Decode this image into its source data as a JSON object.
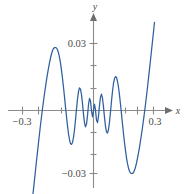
{
  "chart_data": {
    "type": "line",
    "title": "",
    "subtitle": "",
    "xlabel": "x",
    "ylabel": "y",
    "xlim": [
      -0.33,
      0.33
    ],
    "ylim": [
      -0.038,
      0.038
    ],
    "grid": false,
    "legend": null,
    "axis_style": "arrowed-cartesian-axes-through-origin",
    "x_ticks": [
      -0.3,
      -0.2,
      -0.1,
      0.1,
      0.2,
      0.3
    ],
    "x_tick_labels": [
      "-0.3",
      "",
      "",
      "",
      "",
      "0.3"
    ],
    "y_ticks": [
      -0.03,
      -0.02,
      -0.01,
      0.01,
      0.02,
      0.03
    ],
    "y_tick_labels": [
      "-0.03",
      "",
      "",
      "",
      "",
      "0.03"
    ],
    "series": [
      {
        "name": "f(x)",
        "color": "#2e5f9e",
        "description": "even damped-oscillation curve: tiny ripples near the origin whose amplitude grows with |x|, peaks of about 0.028 near x = -0.185 and x = 0.185, crossing zero near x = +/-0.255 and plunging below -0.03 by x = +/-0.30",
        "x": [
          -0.305,
          -0.3,
          -0.295,
          -0.29,
          -0.285,
          -0.28,
          -0.275,
          -0.27,
          -0.265,
          -0.26,
          -0.255,
          -0.25,
          -0.245,
          -0.24,
          -0.235,
          -0.23,
          -0.225,
          -0.22,
          -0.215,
          -0.21,
          -0.205,
          -0.2,
          -0.195,
          -0.19,
          -0.185,
          -0.18,
          -0.175,
          -0.17,
          -0.165,
          -0.16,
          -0.155,
          -0.15,
          -0.145,
          -0.14,
          -0.135,
          -0.13,
          -0.125,
          -0.12,
          -0.115,
          -0.11,
          -0.105,
          -0.1,
          -0.095,
          -0.09,
          -0.085,
          -0.08,
          -0.075,
          -0.07,
          -0.065,
          -0.06,
          -0.055,
          -0.05,
          -0.045,
          -0.04,
          -0.035,
          -0.03,
          -0.025,
          -0.02,
          -0.015,
          -0.01,
          -0.005,
          0.0,
          0.005,
          0.01,
          0.015,
          0.02,
          0.025,
          0.03,
          0.035,
          0.04,
          0.045,
          0.05,
          0.055,
          0.06,
          0.065,
          0.07,
          0.075,
          0.08,
          0.085,
          0.09,
          0.095,
          0.1,
          0.105,
          0.11,
          0.115,
          0.12,
          0.125,
          0.13,
          0.135,
          0.14,
          0.145,
          0.15,
          0.155,
          0.16,
          0.165,
          0.17,
          0.175,
          0.18,
          0.185,
          0.19,
          0.195,
          0.2,
          0.205,
          0.21,
          0.215,
          0.22,
          0.225,
          0.23,
          0.235,
          0.24,
          0.245,
          0.25,
          0.255,
          0.26,
          0.265,
          0.27,
          0.275,
          0.28,
          0.285,
          0.29,
          0.295,
          0.3,
          0.305
        ],
        "y": [
          -0.0395,
          -0.0352,
          -0.031,
          -0.0268,
          -0.0226,
          -0.0185,
          -0.0144,
          -0.0104,
          -0.0065,
          -0.0028,
          0.0008,
          0.0042,
          0.0075,
          0.0106,
          0.0136,
          0.0164,
          0.019,
          0.0213,
          0.0235,
          0.0253,
          0.0268,
          0.0278,
          0.0282,
          0.0282,
          0.028,
          0.0272,
          0.0258,
          0.0238,
          0.0212,
          0.018,
          0.0144,
          0.0104,
          0.0061,
          0.0016,
          -0.0028,
          -0.0069,
          -0.0104,
          -0.0131,
          -0.0148,
          -0.0152,
          -0.0143,
          -0.0121,
          -0.0086,
          -0.0042,
          0.0006,
          0.0051,
          0.0085,
          0.0101,
          0.0096,
          0.0071,
          0.0031,
          -0.0016,
          -0.0055,
          -0.0073,
          -0.0061,
          -0.0023,
          0.0026,
          0.0054,
          0.0044,
          -0.0003,
          -0.0028,
          0.0,
          0.0028,
          0.0003,
          -0.0044,
          -0.0054,
          -0.0026,
          0.0023,
          0.0061,
          0.0073,
          0.0055,
          0.0016,
          -0.0031,
          -0.0071,
          -0.0096,
          -0.0101,
          -0.0085,
          -0.0051,
          -0.0006,
          0.0042,
          0.0086,
          0.0121,
          0.0143,
          0.0152,
          0.0148,
          0.0131,
          0.0104,
          0.0069,
          0.0028,
          -0.0016,
          -0.0061,
          -0.0104,
          -0.0144,
          -0.018,
          -0.0212,
          -0.0238,
          -0.0258,
          -0.0272,
          -0.028,
          -0.0282,
          -0.0282,
          -0.0278,
          -0.0268,
          -0.0253,
          -0.0235,
          -0.0213,
          -0.019,
          -0.0164,
          -0.0136,
          -0.0106,
          -0.0075,
          -0.0042,
          -0.0008,
          0.0028,
          0.0065,
          0.0104,
          0.0144,
          0.0185,
          0.0226,
          0.0268,
          0.031,
          0.0352,
          0.0395
        ]
      }
    ]
  },
  "axes": {
    "x_axis_label": "x",
    "y_axis_label": "y",
    "x_label_left": "−0.3",
    "x_label_right": "0.3",
    "y_label_top": "0.03",
    "y_label_bottom": "−0.03"
  },
  "colors": {
    "curve": "#2e5f9e",
    "axis": "#8a8a8a",
    "text": "#4a4a4a",
    "background": "#ffffff"
  }
}
